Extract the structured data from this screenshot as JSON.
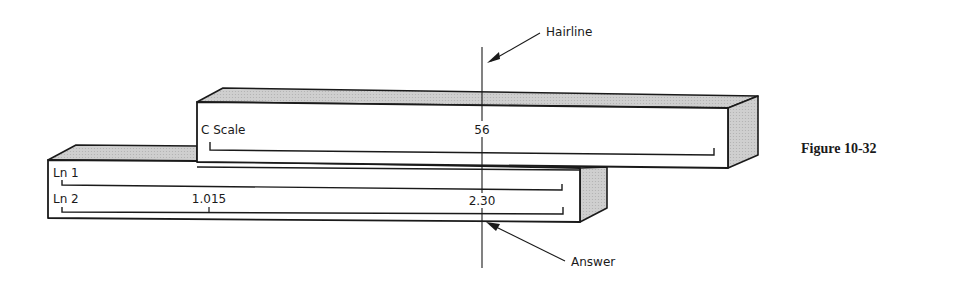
{
  "figure": {
    "caption": "Figure 10-32"
  },
  "slide": {
    "scale_label": "C Scale",
    "reading": "56"
  },
  "body": {
    "scales": [
      {
        "label": "Ln 1"
      },
      {
        "label": "Ln 2",
        "marks": [
          "1.015"
        ],
        "reading": "2.30"
      }
    ]
  },
  "callouts": {
    "hairline": "Hairline",
    "answer": "Answer"
  },
  "colors": {
    "ink": "#1a1a1a",
    "shade": "#c8c8c8",
    "paper": "#ffffff"
  }
}
